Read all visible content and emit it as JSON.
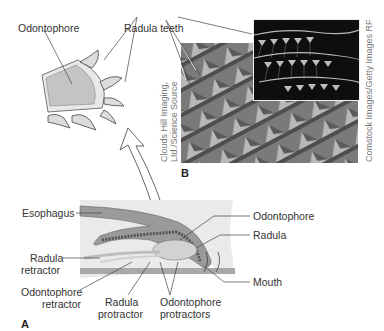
{
  "figure": {
    "panel_a": {
      "letter": "A",
      "labels": {
        "esophagus": "Esophagus",
        "odontophore": "Odontophore",
        "radula": "Radula",
        "radula_retractor_1": "Radula",
        "radula_retractor_2": "retractor",
        "odontophore_retractor_1": "Odontophore",
        "odontophore_retractor_2": "retractor",
        "radula_protractor_1": "Radula",
        "radula_protractor_2": "protractor",
        "odontophore_protractors_1": "Odontophore",
        "odontophore_protractors_2": "protractors",
        "mouth": "Mouth"
      }
    },
    "panel_b": {
      "letter": "B",
      "credit_left": "Clouds Hill Imaging, Ltd./Science Source",
      "credit_left_1": "Clouds Hill Imaging,",
      "credit_left_2": "Ltd./Science Source",
      "credit_right": "Comstock Images/Getty Images RF"
    },
    "inset": {
      "odontophore": "Odontophore",
      "radula_teeth": "Radula teeth"
    },
    "colors": {
      "tissue_light": "#e6e6e6",
      "tissue_mid": "#b5b5b5",
      "tissue_dark": "#8a8a8a",
      "line": "#444444",
      "text": "#333333",
      "credit": "#777777"
    }
  }
}
